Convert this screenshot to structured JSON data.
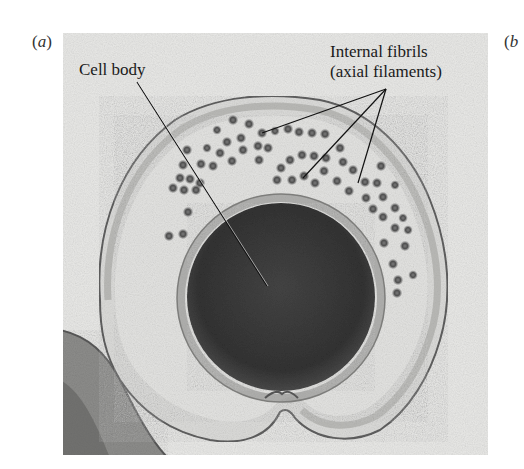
{
  "figure": {
    "panels": [
      {
        "id": "a",
        "open": "(",
        "letter": "a",
        "close": ")"
      },
      {
        "id": "b",
        "open": "(",
        "letter": "b",
        "close": ""
      }
    ],
    "labels": {
      "cell_body": "Cell body",
      "fibrils_line1": "Internal fibrils",
      "fibrils_line2": "(axial filaments)"
    },
    "image_description": "Electron micrograph cross-section of a spirochete showing a dark round cell body surrounded by internal fibrils (axial filaments) within an outer sheath",
    "colors": {
      "background": "#e8e8e6",
      "cell_body": "#3a3a3a",
      "fibril": "#5a5a5a",
      "membrane": "#6a6a6a",
      "text": "#1a1a1a"
    }
  }
}
